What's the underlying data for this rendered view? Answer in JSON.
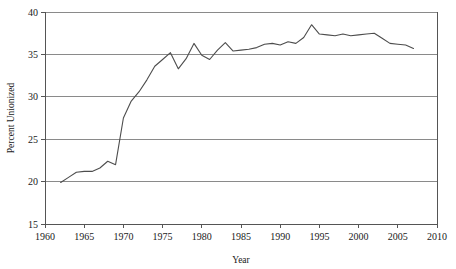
{
  "chart_data": {
    "type": "line",
    "title": "",
    "subtitle": "",
    "xlabel": "Year",
    "ylabel": "Percent Unionized",
    "xlim": [
      1960,
      2010
    ],
    "ylim": [
      15,
      40
    ],
    "xticks": [
      1960,
      1965,
      1970,
      1975,
      1980,
      1985,
      1990,
      1995,
      2000,
      2005,
      2010
    ],
    "yticks": [
      15,
      20,
      25,
      30,
      35,
      40
    ],
    "grid": "horizontal",
    "legend": "none",
    "line_color": "#4d4d4d",
    "series": [
      {
        "name": "Percent Unionized",
        "x": [
          1962,
          1963,
          1964,
          1965,
          1966,
          1967,
          1968,
          1969,
          1970,
          1971,
          1972,
          1973,
          1974,
          1975,
          1976,
          1977,
          1978,
          1979,
          1980,
          1981,
          1982,
          1983,
          1984,
          1985,
          1986,
          1987,
          1988,
          1989,
          1990,
          1991,
          1992,
          1993,
          1994,
          1995,
          1996,
          1997,
          1998,
          1999,
          2000,
          2001,
          2002,
          2003,
          2004,
          2005,
          2006,
          2007
        ],
        "values": [
          19.9,
          20.5,
          21.1,
          21.2,
          21.2,
          21.6,
          22.4,
          22.0,
          27.5,
          29.5,
          30.6,
          32.0,
          33.6,
          34.4,
          35.2,
          33.3,
          34.5,
          36.3,
          34.9,
          34.4,
          35.5,
          36.4,
          35.4,
          35.5,
          35.6,
          35.8,
          36.2,
          36.3,
          36.1,
          36.5,
          36.3,
          37.0,
          38.5,
          37.4,
          37.3,
          37.2,
          37.4,
          37.2,
          37.3,
          37.4,
          37.5,
          36.9,
          36.3,
          36.2,
          36.1,
          35.7
        ]
      }
    ]
  },
  "axes": {
    "y_tick_labels": [
      "40",
      "35",
      "30",
      "25",
      "20",
      "15"
    ],
    "x_tick_labels": [
      "1960",
      "1965",
      "1970",
      "1975",
      "1980",
      "1985",
      "1990",
      "1995",
      "2000",
      "2005",
      "2010"
    ],
    "x_axis_title": "Year",
    "y_axis_title": "Percent Unionized"
  }
}
